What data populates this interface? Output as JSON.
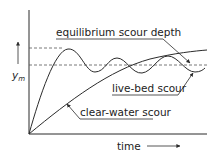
{
  "figure": {
    "title": "",
    "labels": {
      "equilibrium": "equilibrium scour depth",
      "live_bed": "live-bed scour",
      "clear_water": "clear-water scour",
      "x_axis": "time",
      "y_axis_main": "y",
      "y_axis_sub": "m"
    },
    "colors": {
      "line": "#2b2b2b",
      "dashed": "#555555",
      "background": "#ffffff"
    }
  }
}
